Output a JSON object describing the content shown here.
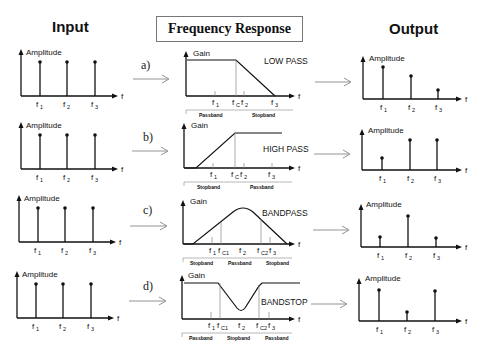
{
  "titles": {
    "input": "Input",
    "frequency_response": "Frequency Response",
    "output": "Output"
  },
  "axis_labels": {
    "amplitude": "Amplitude",
    "gain": "Gain",
    "f": "f"
  },
  "rows": [
    {
      "label": "a)",
      "filter_type": "LOW PASS",
      "freq_ticks": [
        "f1",
        "fc",
        "f2",
        "f3"
      ],
      "bands": [
        "Passband",
        "Stopband"
      ],
      "input_amplitudes": [
        1,
        1,
        1
      ],
      "output_amplitudes": [
        0.9,
        0.6,
        0.25
      ]
    },
    {
      "label": "b)",
      "filter_type": "HIGH PASS",
      "freq_ticks": [
        "f1",
        "fc",
        "f2",
        "f3"
      ],
      "bands": [
        "Stopband",
        "Passband"
      ],
      "input_amplitudes": [
        1,
        1,
        1
      ],
      "output_amplitudes": [
        0.4,
        1,
        1
      ]
    },
    {
      "label": "c)",
      "filter_type": "BANDPASS",
      "freq_ticks": [
        "f1",
        "fC1",
        "f2",
        "fC2",
        "f3"
      ],
      "bands": [
        "Stopband",
        "Passband",
        "Stopband"
      ],
      "input_amplitudes": [
        1,
        1,
        1
      ],
      "output_amplitudes": [
        0.35,
        1,
        0.35
      ]
    },
    {
      "label": "d)",
      "filter_type": "BANDSTOP",
      "freq_ticks": [
        "f1",
        "fC1",
        "f2",
        "fC2",
        "f3"
      ],
      "bands": [
        "Passband",
        "Stopband",
        "Passband"
      ],
      "input_amplitudes": [
        1,
        1,
        1
      ],
      "output_amplitudes": [
        1,
        0.3,
        1
      ]
    }
  ],
  "tick_labels": {
    "f1": "f",
    "f1_sub": "1",
    "f2": "f",
    "f2_sub": "2",
    "f3": "f",
    "f3_sub": "3",
    "fc": "f",
    "fc_sub": "C",
    "fc1": "f",
    "fc1_sub": "C1",
    "fc2": "f",
    "fc2_sub": "C2"
  },
  "band_labels": {
    "a": [
      "Passband",
      "Stopband"
    ],
    "b": [
      "Stopband",
      "Passband"
    ],
    "c": [
      "Stopband",
      "Passband",
      "Stopband"
    ],
    "d": [
      "Passband",
      "Stopband",
      "Passband"
    ]
  }
}
